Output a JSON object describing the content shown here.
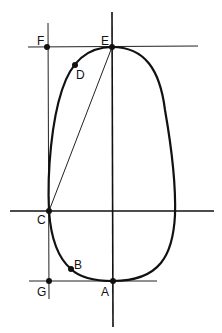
{
  "diagram": {
    "type": "geometric-construction",
    "stroke_color": "#111111",
    "points": [
      {
        "id": "A",
        "label": "A",
        "x": 113,
        "y": 281
      },
      {
        "id": "B",
        "label": "B",
        "x": 71,
        "y": 269
      },
      {
        "id": "C",
        "label": "C",
        "x": 49,
        "y": 211
      },
      {
        "id": "D",
        "label": "D",
        "x": 75,
        "y": 65
      },
      {
        "id": "E",
        "label": "E",
        "x": 112,
        "y": 47
      },
      {
        "id": "F",
        "label": "F",
        "x": 47,
        "y": 47
      },
      {
        "id": "G",
        "label": "G",
        "x": 49,
        "y": 281
      }
    ],
    "lines": [
      {
        "name": "vertical-axis",
        "from": "top",
        "to": "bottom"
      },
      {
        "name": "horizontal-axis-through-C"
      },
      {
        "name": "tangent-line-through-E-and-F"
      },
      {
        "name": "tangent-line-through-G-and-A"
      },
      {
        "name": "vertical-line-through-F-C-G"
      },
      {
        "name": "chord-C-to-E"
      }
    ],
    "curve": "closed oval (egg-shaped) passing through A, B, C, D, E"
  }
}
